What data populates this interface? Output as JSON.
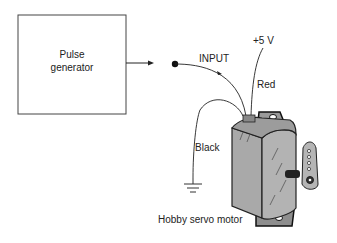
{
  "diagram": {
    "pulse_generator": {
      "line1": "Pulse",
      "line2": "generator"
    },
    "labels": {
      "input": "INPUT",
      "supply": "+5 V",
      "red_wire": "Red",
      "black_wire": "Black",
      "servo": "Hobby servo motor"
    },
    "colors": {
      "line": "#222222",
      "servo_body": "#a9a9a9",
      "servo_dark": "#333333"
    }
  }
}
